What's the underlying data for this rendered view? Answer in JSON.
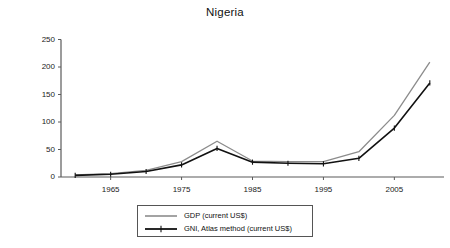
{
  "chart_data": {
    "type": "line",
    "title": "Nigeria",
    "xlabel": "",
    "ylabel": "",
    "x": [
      1960,
      1965,
      1970,
      1975,
      1980,
      1985,
      1990,
      1995,
      2000,
      2005,
      2010
    ],
    "xlim": [
      1958,
      2012
    ],
    "ylim": [
      0,
      250
    ],
    "xticks": [
      1965,
      1975,
      1985,
      1995,
      2005
    ],
    "xtick_labels": [
      "1965",
      "1975",
      "1985",
      "1995",
      "2005"
    ],
    "yticks": [
      0,
      50,
      100,
      150,
      200,
      250
    ],
    "ytick_labels": [
      "0",
      "50",
      "100",
      "150",
      "200",
      "250"
    ],
    "grid": false,
    "legend_position": "bottom-center",
    "series": [
      {
        "name": "GDP (current US$)",
        "color": "#8c8c8c",
        "marker": "none",
        "values": [
          4,
          6,
          12,
          28,
          65,
          29,
          28,
          28,
          46,
          112,
          209
        ]
      },
      {
        "name": "GNI, Atlas method (current US$)",
        "color": "#111111",
        "marker": "plus",
        "values": [
          3,
          5,
          10,
          22,
          52,
          27,
          25,
          24,
          34,
          89,
          171
        ]
      }
    ]
  },
  "legend": {
    "items": [
      {
        "label": "GDP (current US$)"
      },
      {
        "label": "GNI, Atlas method (current US$)"
      }
    ]
  },
  "colors": {
    "axis": "#5a5a5a",
    "gdp_line": "#8c8c8c",
    "gni_line": "#111111",
    "text": "#111111",
    "background": "#ffffff"
  }
}
